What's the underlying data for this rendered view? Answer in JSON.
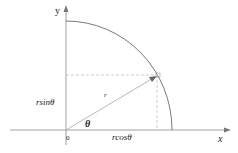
{
  "diagram": {
    "type": "polar-coordinate-diagram",
    "axes": {
      "x_label": "x",
      "y_label": "y",
      "origin_label": "0"
    },
    "labels": {
      "radius": "r",
      "angle": "θ",
      "vertical_projection": "rsinθ",
      "horizontal_projection": "rcosθ"
    },
    "colors": {
      "axis": "#8a8a8a",
      "arc": "#555555",
      "radius_line": "#b8b8b8",
      "dashed": "#c8c8c8",
      "text": "#222222"
    }
  }
}
